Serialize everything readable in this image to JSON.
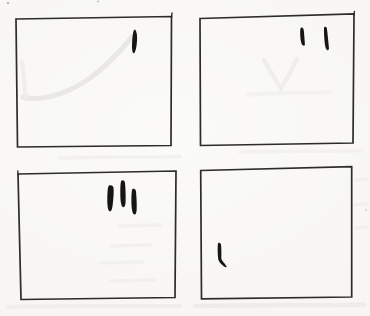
{
  "figure": {
    "colors": {
      "paper": "#f7f6f3",
      "border": "#2d2c2a",
      "ink": "#161514",
      "faint": "#e9e8e4",
      "bleed": "#eeede9",
      "speck": "#8f8d89"
    },
    "panels": [
      {
        "name": "panel-top-left",
        "tally_count": 1,
        "outline_points": "16,19 171.5,16.5 171,145.5 17.5,147",
        "overshoots": [
          {
            "x1": 171.5,
            "y1": 17.5,
            "x2": 172,
            "y2": 13
          }
        ],
        "faint_marks": [
          {
            "name": "faint-pencil-curve",
            "d": "M23,97 C40,102 68,94 90,78 C104,68 122,50 131.5,37",
            "width": 5,
            "color": "#e9e8e4"
          },
          {
            "name": "faint-pencil-curve",
            "d": "M22,62 C24,74 24,88 26,97",
            "width": 4,
            "color": "#efeeea"
          }
        ],
        "marks": [
          {
            "name": "tally-stroke",
            "d": "M135.2,29.5 C136.8,31.5 137.4,36 137,41 C136.6,46 135.8,51 134.2,53.2 C132.9,53.8 132.1,51.5 132,47.5 C131.9,42 132.4,35.5 133.4,31.5 C133.9,30 134.5,29.2 135.2,29.5 Z"
          }
        ]
      },
      {
        "name": "panel-top-right",
        "tally_count": 2,
        "outline_points": "200,18.5 354,14 353,143 200.5,145.5",
        "overshoots": [
          {
            "x1": 354,
            "y1": 15,
            "x2": 354.4,
            "y2": 11.5
          }
        ],
        "faint_marks": [
          {
            "name": "faint-pencil-vee",
            "d": "M264,60 C270,70 276,82 281,88 C285,82 292,70 297,59",
            "width": 4.5,
            "color": "#efeeea"
          }
        ],
        "marks": [
          {
            "name": "tally-stroke",
            "d": "M301.2,27.6 C302.6,27.2 303.6,28.4 303.8,30.5 C304.2,34.5 304.6,40 304.9,44 C305,45.4 304.2,46 303.2,45.6 C301.9,45.1 301,43 300.6,39.5 C300.2,35.5 300,30.5 300.4,29 C300.6,28.2 300.8,27.8 301.2,27.6 Z"
          },
          {
            "name": "tally-stroke",
            "d": "M324.6,26.8 C325.8,26.3 326.8,27.2 327,29 C327.6,34 328.4,42 328.9,47.5 C329.1,49.5 328.4,50.6 327.4,50.2 C326.2,49.7 325.3,47.5 324.8,43.5 C324.3,38.5 323.8,31 324,28.5 C324.1,27.6 324.2,27.1 324.6,26.8 Z"
          }
        ]
      },
      {
        "name": "panel-bottom-left",
        "tally_count": 3,
        "outline_points": "18,174 176,171 175,297.5 21,299.5",
        "overshoots": [
          {
            "x1": 18.2,
            "y1": 175,
            "x2": 17.8,
            "y2": 171
          }
        ],
        "faint_marks": [],
        "marks": [
          {
            "name": "tally-stroke",
            "d": "M109.2,185.6 C111.4,184.8 113.4,186 113.6,188.5 C113.9,193 113.3,200 112.6,205.5 C112.2,209 111.2,211.6 109.9,211.4 C108.5,211.2 107.6,208.5 107.4,204 C107.2,198.5 107.4,191 108,188 C108.2,186.8 108.6,185.9 109.2,185.6 Z"
          },
          {
            "name": "tally-stroke",
            "d": "M121.8,180.4 C123.4,179.8 124.8,180.8 125,183 C125.5,188 125.8,196 125.6,201.5 C125.5,205 124.7,207.3 123.4,207.2 C122,207.1 121,204.8 120.6,200.5 C120.2,195 120.2,186.5 120.7,183 C120.9,181.6 121.2,180.7 121.8,180.4 Z"
          },
          {
            "name": "tally-stroke",
            "d": "M132.8,188.8 C134.4,188.2 135.8,189.2 136,191.5 C136.5,196.5 136.9,204 136.7,209 C136.6,212.5 135.8,214.8 134.5,214.6 C133.1,214.4 132.1,212 131.7,207.5 C131.3,202 131.3,194.5 131.9,191 C132,189.9 132.3,189.1 132.8,188.8 Z"
          }
        ]
      },
      {
        "name": "panel-bottom-right",
        "tally_count": 1,
        "outline_points": "200.7,170.5 351.7,166.7 351.7,297 201.5,298.8",
        "overshoots": [],
        "faint_marks": [],
        "marks": [
          {
            "name": "tally-stroke",
            "d": "M218.6,242.8 C219.9,242.3 220.9,243.3 221.1,245.3 C221.4,249 221.5,254 221.3,257.8 C221.3,258.8 221.5,259.6 222.2,260.6 C223.5,262.4 225.4,264.4 226.3,266 C226.8,266.9 226.4,267.5 225.5,267.2 C223.8,266.6 221.3,264.6 219.9,262.6 C219.1,261.5 218.3,260 218.1,258 C217.7,254 217.5,248 217.8,245 C217.9,243.8 218.1,243 218.6,242.8 Z"
          }
        ]
      }
    ],
    "bleed_smudges": [
      {
        "d": "M8,307 C60,305 130,306.5 180,306",
        "width": 4,
        "color": "#efeeea"
      },
      {
        "d": "M195,306 C250,304.5 320,306 364,304.5",
        "width": 4.5,
        "color": "#edece8"
      },
      {
        "d": "M120,226 L160,225",
        "width": 3.5,
        "color": "#f1f0ec"
      },
      {
        "d": "M112,246 L150,245",
        "width": 3.5,
        "color": "#f1f0ec"
      },
      {
        "d": "M100,263 L142,262",
        "width": 3.5,
        "color": "#f2f1ed"
      },
      {
        "d": "M110,281 L156,280",
        "width": 3.5,
        "color": "#f1f0ec"
      },
      {
        "d": "M356,180 L366,179",
        "width": 3.5,
        "color": "#f0efeb"
      },
      {
        "d": "M355,205 L367,204",
        "width": 3.5,
        "color": "#f1f0ec"
      },
      {
        "d": "M356,228 L366,227",
        "width": 3.5,
        "color": "#f1f0ec"
      },
      {
        "d": "M248,95 C270,92 300,94 330,92",
        "width": 4,
        "color": "#f3f2ee"
      },
      {
        "d": "M60,158 C110,156 150,157.5 180,156.5",
        "width": 3.5,
        "color": "#f2f1ed"
      },
      {
        "d": "M240,152 C280,150.5 330,152 362,150.5",
        "width": 3.5,
        "color": "#f2f1ed"
      }
    ],
    "specks": [
      {
        "cx": 8,
        "cy": 3,
        "r": 1.2
      },
      {
        "cx": 98,
        "cy": 1.5,
        "r": 0.9
      },
      {
        "cx": 366,
        "cy": 210,
        "r": 0.8
      }
    ]
  }
}
